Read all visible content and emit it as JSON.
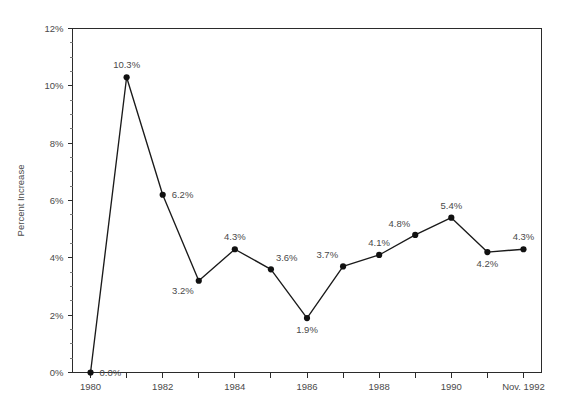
{
  "chart_data": {
    "type": "line",
    "title": "",
    "subtitle": "",
    "xlabel": "",
    "ylabel": "Percent Increase",
    "x": [
      1980,
      1981,
      1982,
      1983,
      1984,
      1985,
      1986,
      1987,
      1988,
      1989,
      1990,
      1991,
      1992
    ],
    "values": [
      0.0,
      10.3,
      6.2,
      3.2,
      4.3,
      3.6,
      1.9,
      3.7,
      4.1,
      4.8,
      5.4,
      4.2,
      4.3
    ],
    "point_labels": [
      "0.0%",
      "10.3%",
      "6.2%",
      "3.2%",
      "4.3%",
      "3.6%",
      "1.9%",
      "3.7%",
      "4.1%",
      "4.8%",
      "5.4%",
      "4.2%",
      "4.3%"
    ],
    "label_placement": [
      "right",
      "above",
      "right",
      "below-left",
      "above",
      "above-right",
      "below",
      "above-left",
      "above",
      "above-left",
      "above",
      "below",
      "above"
    ],
    "xlim": [
      1979.5,
      1992.5
    ],
    "ylim": [
      0,
      12
    ],
    "ytick_values": [
      0,
      2,
      4,
      6,
      8,
      10,
      12
    ],
    "ytick_labels": [
      "0%",
      "2%",
      "4%",
      "6%",
      "8%",
      "10%",
      "12%"
    ],
    "yminor_step": 0.5,
    "xtick_values": [
      1980,
      1981,
      1982,
      1983,
      1984,
      1985,
      1986,
      1987,
      1988,
      1989,
      1990,
      1991,
      1992
    ],
    "xtick_labels": [
      "1980",
      "",
      "1982",
      "",
      "1984",
      "",
      "1986",
      "",
      "1988",
      "",
      "1990",
      "",
      "Nov. 1992"
    ],
    "grid": false,
    "legend": false,
    "legend_position": "none",
    "line_color": "#1a1a1a",
    "marker_color": "#111111",
    "axis_color": "#2b2b2b",
    "text_color": "#4a4a4a",
    "background_color": "#ffffff"
  }
}
